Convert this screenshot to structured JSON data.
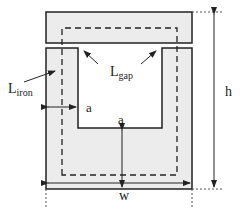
{
  "diagram": {
    "type": "magnetic core with air gap",
    "labels": {
      "iron_path": {
        "main": "L",
        "sub": "iron"
      },
      "gap_path": {
        "main": "L",
        "sub": "gap"
      },
      "width_a_side": "a",
      "width_a_bottom": "a",
      "height": "h",
      "width": "w"
    },
    "colors": {
      "core_fill": "#ececec",
      "outline": "#222222",
      "dashed_path": "#222222",
      "dimension": "#333333"
    }
  }
}
